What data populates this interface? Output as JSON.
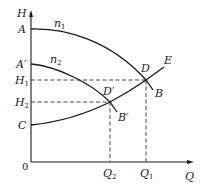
{
  "diagram": {
    "axes": {
      "y_label": "H",
      "x_label": "Q",
      "origin_label": "0"
    },
    "curves": {
      "n1": "n1",
      "n2": "n2",
      "system": "E"
    },
    "points": {
      "A": "A",
      "A_prime": "A′",
      "C": "C",
      "D": "D",
      "D_prime": "D′",
      "B": "B",
      "B_prime": "B′"
    },
    "levels": {
      "H1": {
        "main": "H",
        "sub": "1"
      },
      "H2": {
        "main": "H",
        "sub": "2"
      },
      "Q1": {
        "main": "Q",
        "sub": "1"
      },
      "Q2": {
        "main": "Q",
        "sub": "2"
      }
    },
    "curve_labels": {
      "n1": {
        "main": "n",
        "sub": "1"
      },
      "n2": {
        "main": "n",
        "sub": "2"
      }
    }
  }
}
